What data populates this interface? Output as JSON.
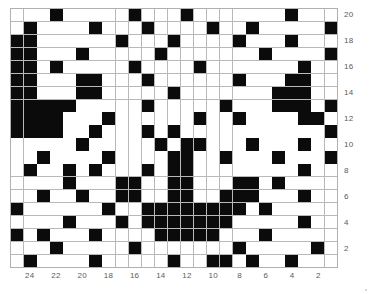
{
  "chart_data": {
    "type": "heatmap",
    "title": "",
    "subtitle": "",
    "xlabel": "",
    "ylabel": "",
    "grid": true,
    "legend": null,
    "n_cols": 25,
    "n_rows": 20,
    "value_colors": {
      "0": "#ffffff",
      "1": "#0b0b0b"
    },
    "gridline_color": "#b9b9b9",
    "label_color": "#5a5a5a",
    "x_axis": {
      "position": "bottom",
      "direction": "descending",
      "tick_labels": [
        "24",
        "22",
        "20",
        "18",
        "16",
        "14",
        "12",
        "10",
        "8",
        "6",
        "4",
        "2"
      ],
      "tick_columns": [
        2,
        4,
        6,
        8,
        10,
        12,
        14,
        16,
        18,
        20,
        22,
        24
      ],
      "range": [
        25,
        1
      ]
    },
    "y_axis": {
      "position": "right",
      "direction": "descending",
      "tick_labels": [
        "20",
        "18",
        "16",
        "14",
        "12",
        "10",
        "8",
        "6",
        "4",
        "2"
      ],
      "tick_rows": [
        1,
        3,
        5,
        7,
        9,
        11,
        13,
        15,
        17,
        19
      ],
      "range": [
        20,
        1
      ]
    },
    "rows": [
      [
        0,
        0,
        0,
        1,
        0,
        0,
        0,
        0,
        0,
        1,
        0,
        0,
        0,
        1,
        0,
        0,
        0,
        0,
        0,
        0,
        0,
        1,
        0,
        0,
        0
      ],
      [
        0,
        1,
        0,
        0,
        0,
        0,
        1,
        0,
        0,
        0,
        1,
        0,
        0,
        0,
        0,
        1,
        0,
        0,
        1,
        0,
        0,
        0,
        0,
        0,
        1
      ],
      [
        1,
        1,
        0,
        0,
        0,
        0,
        0,
        0,
        1,
        0,
        0,
        0,
        1,
        0,
        0,
        0,
        0,
        1,
        0,
        0,
        0,
        1,
        0,
        0,
        0
      ],
      [
        1,
        1,
        0,
        0,
        0,
        1,
        0,
        0,
        0,
        0,
        0,
        1,
        0,
        0,
        0,
        0,
        0,
        0,
        0,
        1,
        0,
        0,
        0,
        0,
        1
      ],
      [
        1,
        1,
        0,
        1,
        0,
        0,
        0,
        0,
        0,
        1,
        0,
        0,
        0,
        0,
        1,
        0,
        0,
        0,
        0,
        0,
        0,
        0,
        1,
        0,
        0
      ],
      [
        1,
        1,
        0,
        0,
        0,
        1,
        1,
        0,
        0,
        0,
        1,
        0,
        0,
        0,
        0,
        0,
        0,
        1,
        0,
        0,
        0,
        1,
        1,
        0,
        0
      ],
      [
        1,
        1,
        0,
        0,
        0,
        1,
        1,
        0,
        0,
        0,
        0,
        0,
        1,
        0,
        0,
        0,
        0,
        0,
        0,
        0,
        1,
        1,
        1,
        0,
        0
      ],
      [
        1,
        1,
        1,
        1,
        1,
        0,
        0,
        0,
        0,
        0,
        1,
        0,
        0,
        0,
        0,
        0,
        1,
        0,
        0,
        0,
        1,
        1,
        1,
        0,
        1
      ],
      [
        1,
        1,
        1,
        1,
        0,
        0,
        0,
        1,
        0,
        0,
        0,
        0,
        0,
        0,
        1,
        0,
        0,
        1,
        0,
        0,
        0,
        0,
        1,
        1,
        0
      ],
      [
        1,
        1,
        1,
        1,
        0,
        0,
        1,
        0,
        0,
        0,
        1,
        0,
        1,
        0,
        0,
        0,
        0,
        0,
        0,
        0,
        0,
        0,
        0,
        0,
        1
      ],
      [
        0,
        0,
        0,
        0,
        0,
        1,
        0,
        0,
        0,
        0,
        0,
        1,
        0,
        1,
        1,
        0,
        0,
        0,
        1,
        0,
        0,
        0,
        1,
        0,
        0
      ],
      [
        0,
        0,
        1,
        0,
        0,
        0,
        0,
        1,
        0,
        0,
        0,
        0,
        1,
        1,
        0,
        0,
        1,
        0,
        0,
        0,
        1,
        0,
        0,
        0,
        1
      ],
      [
        0,
        1,
        0,
        0,
        1,
        0,
        1,
        0,
        0,
        0,
        1,
        0,
        1,
        1,
        0,
        0,
        0,
        0,
        0,
        0,
        0,
        0,
        1,
        0,
        0
      ],
      [
        0,
        0,
        0,
        0,
        1,
        0,
        0,
        0,
        1,
        1,
        0,
        0,
        1,
        1,
        0,
        0,
        0,
        1,
        1,
        0,
        1,
        0,
        0,
        0,
        0
      ],
      [
        0,
        0,
        1,
        0,
        0,
        1,
        0,
        0,
        1,
        1,
        0,
        0,
        1,
        1,
        0,
        0,
        1,
        1,
        1,
        0,
        0,
        0,
        1,
        0,
        0
      ],
      [
        1,
        0,
        0,
        0,
        0,
        0,
        0,
        1,
        0,
        0,
        1,
        1,
        1,
        1,
        1,
        1,
        1,
        1,
        0,
        1,
        0,
        0,
        0,
        0,
        0
      ],
      [
        0,
        0,
        0,
        0,
        1,
        0,
        0,
        0,
        1,
        0,
        1,
        1,
        1,
        1,
        1,
        1,
        1,
        0,
        0,
        0,
        0,
        0,
        1,
        0,
        0
      ],
      [
        1,
        0,
        1,
        0,
        0,
        0,
        1,
        0,
        0,
        0,
        0,
        1,
        1,
        1,
        1,
        1,
        0,
        0,
        0,
        1,
        0,
        0,
        0,
        0,
        0
      ],
      [
        0,
        0,
        0,
        1,
        0,
        0,
        0,
        0,
        0,
        1,
        0,
        0,
        0,
        0,
        0,
        0,
        0,
        1,
        0,
        0,
        0,
        0,
        0,
        1,
        0
      ],
      [
        0,
        1,
        0,
        0,
        0,
        0,
        1,
        0,
        0,
        0,
        0,
        0,
        1,
        0,
        0,
        1,
        1,
        0,
        1,
        0,
        0,
        1,
        0,
        0,
        0
      ]
    ]
  }
}
